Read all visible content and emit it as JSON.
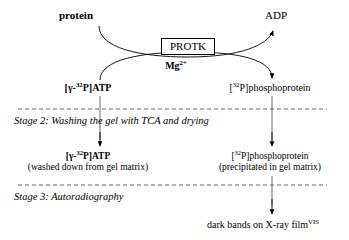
{
  "diagram": {
    "title_semantic": "protein-kinase-assay-stages",
    "reaction": {
      "substrate_label": "protein",
      "product_label": "ADP",
      "enzyme_label": "PROTK",
      "cofactor_label_base": "Mg",
      "cofactor_label_sup": "2+",
      "donor_label": {
        "pre": "[γ-",
        "sup": "32",
        "post": "P]ATP"
      },
      "acceptor_label": {
        "pre": "[",
        "sup": "32",
        "post": "P]phosphoprotein"
      }
    },
    "stage2": {
      "caption": "Stage 2: Washing the gel with TCA and drying",
      "left_item": {
        "pre": "[γ-",
        "sup": "32",
        "post": "P]ATP",
        "note": "(washed down from gel matrix)"
      },
      "right_item": {
        "pre": "[",
        "sup": "32",
        "post": "P]phosphoprotein",
        "note": "(precipitated in gel matrix)"
      }
    },
    "stage3": {
      "caption": "Stage 3: Autoradiography",
      "result": "dark bands on X-ray film",
      "result_sup": "VIS"
    },
    "colors": {
      "ink": "#000000",
      "rule": "#555555",
      "background": "#ffffff"
    }
  }
}
